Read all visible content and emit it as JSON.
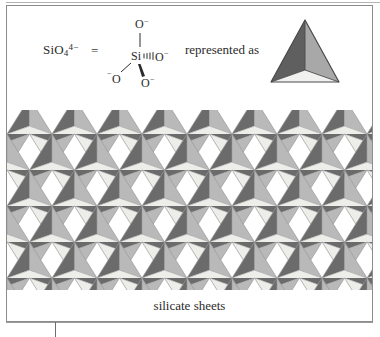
{
  "figure": {
    "caption": "silicate sheets",
    "connector_text": "represented as",
    "equals_symbol": "=",
    "formula": {
      "base": "SiO",
      "subscript": "4",
      "superscript": "4−"
    },
    "lewis": {
      "center_atom": "Si",
      "oxygen_top": "O",
      "oxygen_top_charge": "−",
      "oxygen_right": "O",
      "oxygen_right_charge": "−",
      "oxygen_lower_left": "O",
      "oxygen_lower_left_charge": "−",
      "oxygen_lower_right": "O",
      "oxygen_lower_right_charge": "−",
      "bond_styles": [
        "plain-line-up",
        "hashed-wedge-right",
        "plain-line-lower-left",
        "bold-wedge-lower-right"
      ]
    },
    "tetrahedron": {
      "face_left_color": "#5f5f5f",
      "face_right_color": "#a8a8a8",
      "face_bottom_color": "#f0f0ee",
      "outline_color": "#4a4a4a"
    },
    "lattice": {
      "description": "hexagonal network of corner-sharing SiO4 tetrahedra",
      "rows": 6,
      "columns": 9,
      "cell_width": 45,
      "row_height": 36,
      "dark_face_color": "#6b6b6b",
      "mid_face_color": "#b9b9b9",
      "light_face_color": "#ededea",
      "edge_line_color": "#9a9a9a"
    },
    "colors": {
      "frame_border": "#8c8c8c",
      "background": "#ffffff",
      "text": "#2b2b2b"
    }
  }
}
